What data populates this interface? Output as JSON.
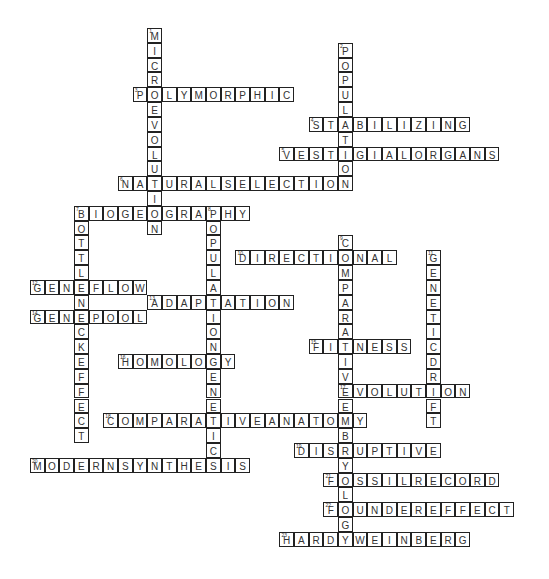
{
  "puzzle": {
    "grid": {
      "origin_x": 30,
      "origin_y": 28,
      "cell_w": 14.67,
      "cell_h": 14.82
    },
    "words": [
      {
        "num": 1,
        "answer": "MICROEVOLUTION",
        "dir": "down",
        "row": 0,
        "col": 8
      },
      {
        "num": 2,
        "answer": "POPULATION",
        "dir": "down",
        "row": 1,
        "col": 21
      },
      {
        "num": 3,
        "answer": "POLYMORPHIC",
        "dir": "across",
        "row": 4,
        "col": 7
      },
      {
        "num": 4,
        "answer": "STABILIZING",
        "dir": "across",
        "row": 6,
        "col": 19
      },
      {
        "num": 5,
        "answer": "VESTIGIALORGANS",
        "dir": "across",
        "row": 8,
        "col": 17
      },
      {
        "num": 6,
        "answer": "NATURALSELECTION",
        "dir": "across",
        "row": 10,
        "col": 6
      },
      {
        "num": 7,
        "answer": "BIOGEOGRAPHY",
        "dir": "across",
        "row": 12,
        "col": 3
      },
      {
        "num": 7,
        "answer": "BOTTLENECKEFFECT",
        "dir": "down",
        "row": 12,
        "col": 3
      },
      {
        "num": 8,
        "answer": "POPULATIONGENETICS",
        "dir": "down",
        "row": 12,
        "col": 12
      },
      {
        "num": 9,
        "answer": "COMPARATIVEEMBRYOLOGY",
        "dir": "down",
        "row": 14,
        "col": 21
      },
      {
        "num": 10,
        "answer": "DIRECTIONAL",
        "dir": "across",
        "row": 15,
        "col": 14
      },
      {
        "num": 11,
        "answer": "GENETICDRIFT",
        "dir": "down",
        "row": 15,
        "col": 27
      },
      {
        "num": 12,
        "answer": "GENEFLOW",
        "dir": "across",
        "row": 17,
        "col": 0
      },
      {
        "num": 13,
        "answer": "ADAPTATION",
        "dir": "across",
        "row": 18,
        "col": 8
      },
      {
        "num": 14,
        "answer": "GENEPOOL",
        "dir": "across",
        "row": 19,
        "col": 0
      },
      {
        "num": 15,
        "answer": "FITNESS",
        "dir": "across",
        "row": 21,
        "col": 19
      },
      {
        "num": 16,
        "answer": "HOMOLOGY",
        "dir": "across",
        "row": 22,
        "col": 6
      },
      {
        "num": 17,
        "answer": "EVOLUTION",
        "dir": "across",
        "row": 24,
        "col": 21
      },
      {
        "num": 18,
        "answer": "COMPARATIVEANATOMY",
        "dir": "across",
        "row": 26,
        "col": 5
      },
      {
        "num": 19,
        "answer": "DISRUPTIVE",
        "dir": "across",
        "row": 28,
        "col": 18
      },
      {
        "num": 20,
        "answer": "MODERNSYNTHESIS",
        "dir": "across",
        "row": 29,
        "col": 0
      },
      {
        "num": 21,
        "answer": "FOSSILRECORD",
        "dir": "across",
        "row": 30,
        "col": 20
      },
      {
        "num": 22,
        "answer": "FOUNDEREFFECT",
        "dir": "across",
        "row": 32,
        "col": 20
      },
      {
        "num": 23,
        "answer": "HARDYWEINBERG",
        "dir": "across",
        "row": 34,
        "col": 17
      }
    ]
  }
}
